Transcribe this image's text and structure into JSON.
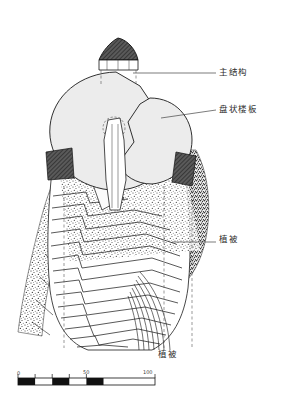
{
  "figure": {
    "type": "architectural-section-drawing",
    "title_visible": false,
    "background_color": "#ffffff",
    "ink_color": "#1a1a1a",
    "slab_fill_color": "#ececec",
    "dark_fill_color": "#4a4a4a"
  },
  "annotations": [
    {
      "id": "main-structure",
      "label": "主结构",
      "leader": {
        "x1": 133,
        "y1": 73,
        "x2": 216,
        "y2": 73
      },
      "label_pos": {
        "x": 219,
        "y": 68
      }
    },
    {
      "id": "disc-slab",
      "label": "盘状楼板",
      "leader": {
        "x1": 161,
        "y1": 118,
        "x2": 216,
        "y2": 110
      },
      "label_pos": {
        "x": 219,
        "y": 105
      }
    },
    {
      "id": "vegetation-right",
      "label": "植被",
      "leader": {
        "x1": 172,
        "y1": 242,
        "x2": 216,
        "y2": 242
      },
      "label_pos": {
        "x": 219,
        "y": 235
      }
    },
    {
      "id": "vegetation-bottom",
      "label": "植被",
      "leader": null,
      "label_pos": {
        "x": 158,
        "y": 350
      }
    }
  ],
  "scale_bar": {
    "ticks": [
      "0",
      "50",
      "100"
    ],
    "start_x": 18,
    "end_x": 155,
    "y": 378,
    "height": 7,
    "segments": 8,
    "unit_implied": "m"
  },
  "drawing_elements": {
    "roof_cap": "dark hatched conical roof at apex",
    "dashed_guides": "vertical dashed construction lines",
    "discs": "two large overlapping light-gray circular floor plates",
    "terraces": "stacked stepped/spiral terrace contours",
    "stipple": "dense stippled vegetation texture on flanks"
  }
}
